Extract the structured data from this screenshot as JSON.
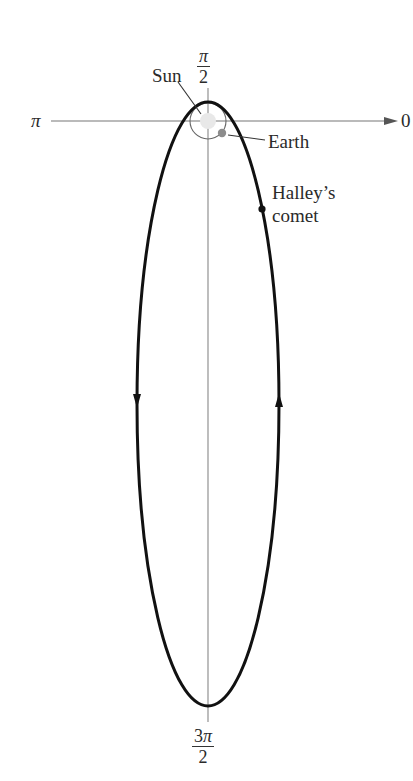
{
  "diagram": {
    "axis_labels": {
      "top": {
        "numerator_coef": "",
        "numerator_sym": "π",
        "denominator": "2"
      },
      "bottom": {
        "numerator_coef": "3",
        "numerator_sym": "π",
        "denominator": "2"
      },
      "left": "π",
      "right": "0"
    },
    "labels": {
      "sun": "Sun",
      "earth": "Earth",
      "comet_line1": "Halley’s",
      "comet_line2": "comet"
    },
    "colors": {
      "orbit": "#111111",
      "axis": "#777777",
      "sun_fill": "#e6e6e6",
      "earth_orbit": "#555555",
      "earth_fill": "#8c8c8c",
      "comet": "#111111"
    },
    "geometry": {
      "pole": [
        208,
        121
      ],
      "orbit_center": [
        208,
        404
      ],
      "orbit_rx": 71,
      "orbit_ry": 302,
      "earth_orbit_r": 18,
      "earth_pos": [
        222,
        133
      ],
      "comet_pos": [
        262,
        209
      ],
      "direction": "counterclockwise"
    }
  }
}
